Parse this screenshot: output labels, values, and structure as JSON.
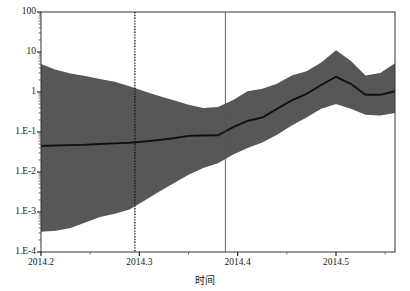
{
  "chart_data": {
    "type": "area",
    "title": "",
    "xlabel": "时间",
    "ylabel": "",
    "yscale": "log",
    "ylim": [
      0.0001,
      100
    ],
    "xlim": [
      2014.2,
      2014.56
    ],
    "grid": false,
    "legend": null,
    "y_ticks": [
      {
        "value": 100,
        "label": "100"
      },
      {
        "value": 10,
        "label": "10"
      },
      {
        "value": 1,
        "label": "1"
      },
      {
        "value": 0.1,
        "label": "1.E-1"
      },
      {
        "value": 0.01,
        "label": "1.E-2"
      },
      {
        "value": 0.001,
        "label": "1.E-3"
      },
      {
        "value": 0.0001,
        "label": "1.E-4"
      }
    ],
    "x_ticks": [
      {
        "value": 2014.2,
        "label": "2014.2"
      },
      {
        "value": 2014.3,
        "label": "2014.3"
      },
      {
        "value": 2014.4,
        "label": "2014.4"
      },
      {
        "value": 2014.5,
        "label": "2014.5"
      }
    ],
    "x_minor_ticks": [
      2014.25,
      2014.35,
      2014.45,
      2014.55
    ],
    "reference_lines": [
      {
        "name": "dotted-reference-line",
        "x": 2014.2955,
        "style": "dotted",
        "color": "#111111"
      },
      {
        "name": "solid-reference-line",
        "x": 2014.3875,
        "style": "solid",
        "color": "#555555"
      }
    ],
    "band_color": "#575757",
    "median_color": "#111111",
    "x": [
      2014.2,
      2014.215,
      2014.23,
      2014.245,
      2014.26,
      2014.275,
      2014.29,
      2014.305,
      2014.32,
      2014.335,
      2014.35,
      2014.365,
      2014.38,
      2014.395,
      2014.41,
      2014.425,
      2014.44,
      2014.455,
      2014.47,
      2014.485,
      2014.5,
      2014.515,
      2014.53,
      2014.545,
      2014.56
    ],
    "series": [
      {
        "name": "upper-bound",
        "values": [
          5.0,
          3.6,
          2.9,
          2.5,
          2.1,
          1.8,
          1.4,
          1.05,
          0.8,
          0.62,
          0.48,
          0.4,
          0.42,
          0.62,
          1.05,
          1.2,
          1.6,
          2.6,
          3.3,
          5.5,
          11.0,
          6.0,
          2.6,
          3.0,
          5.2
        ]
      },
      {
        "name": "median",
        "values": [
          0.045,
          0.046,
          0.047,
          0.048,
          0.05,
          0.052,
          0.054,
          0.058,
          0.063,
          0.07,
          0.08,
          0.082,
          0.083,
          0.13,
          0.19,
          0.23,
          0.38,
          0.62,
          0.9,
          1.5,
          2.4,
          1.6,
          0.85,
          0.85,
          1.05
        ]
      },
      {
        "name": "lower-bound",
        "values": [
          0.00032,
          0.00034,
          0.0004,
          0.00055,
          0.00075,
          0.0009,
          0.00115,
          0.0019,
          0.0032,
          0.0052,
          0.0085,
          0.0125,
          0.0165,
          0.027,
          0.04,
          0.055,
          0.085,
          0.145,
          0.23,
          0.38,
          0.5,
          0.38,
          0.27,
          0.26,
          0.3
        ]
      }
    ]
  },
  "axis": {
    "x_title": "时间"
  }
}
